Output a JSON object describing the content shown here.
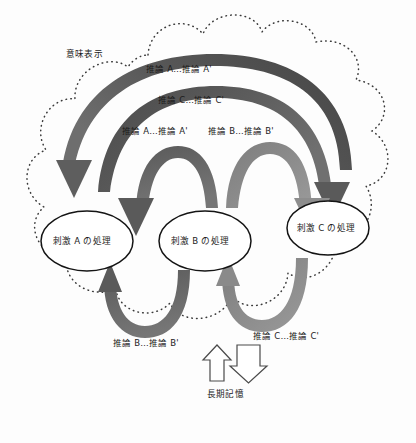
{
  "figure": {
    "type": "conceptual-diagram",
    "title_visible": false,
    "background_color": "#fdfdfd",
    "cloud": {
      "name": "semantic-representation-cloud",
      "label": "意味表示",
      "border_style": "dotted",
      "border_color": "#3a3a3a"
    },
    "nodes": [
      {
        "id": "a",
        "label": "刺激 A の処理",
        "cx": 87,
        "cy": 241,
        "rx": 46,
        "ry": 30
      },
      {
        "id": "b",
        "label": "刺激 B の処理",
        "cx": 205,
        "cy": 241,
        "rx": 46,
        "ry": 30
      },
      {
        "id": "c",
        "label": "刺激 C の処理",
        "cx": 328,
        "cy": 228,
        "rx": 41,
        "ry": 27
      }
    ],
    "arrow_labels": {
      "top_outer": "推論 A…推論 A'",
      "top_second": "推論 C…推論 C'",
      "mid_left": "推論 A…推論 A'",
      "mid_right": "推論 B…推論 B'",
      "bottom_left": "推論 B…推論 B'",
      "bottom_right": "推論 C…推論 C'"
    },
    "memory": {
      "label": "長期記憶",
      "up_arrow": "up-arrow-icon",
      "down_arrow": "down-arrow-icon",
      "outline_color": "#4a4a4a"
    },
    "colors": {
      "arrow_dark": "#4f4f4f",
      "arrow_mid": "#616161",
      "arrow_light": "#8b8b8b",
      "node_stroke": "#141414",
      "text": "#1b1b1b",
      "cloud_dots": "#3a3a3a"
    }
  }
}
